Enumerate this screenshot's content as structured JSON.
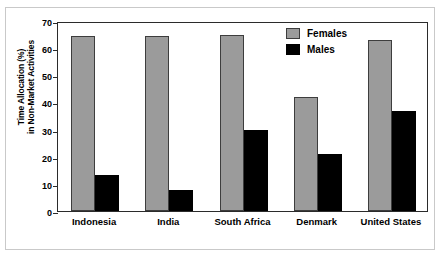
{
  "chart_data": {
    "type": "bar",
    "title": "",
    "xlabel": "",
    "ylabel": "Time Allocation (%) in Non-Market Activities",
    "ylabel_lines": [
      "Time Allocation (%)",
      "in Non-Market Activities"
    ],
    "categories": [
      "Indonesia",
      "India",
      "South Africa",
      "Denmark",
      "United States"
    ],
    "series": [
      {
        "name": "Females",
        "color": "#9b9b9b",
        "values": [
          64.3,
          64.3,
          65.0,
          42.0,
          63.0
        ]
      },
      {
        "name": "Males",
        "color": "#000000",
        "values": [
          13.3,
          7.8,
          30.0,
          21.0,
          36.7
        ]
      }
    ],
    "ylim": [
      0,
      70
    ],
    "yticks": [
      0,
      10,
      20,
      30,
      40,
      50,
      60,
      70
    ],
    "ytick_labels": [
      "0",
      "10",
      "20",
      "30",
      "40",
      "50",
      "60",
      "70"
    ],
    "grid": false,
    "legend_position": "top-right"
  }
}
